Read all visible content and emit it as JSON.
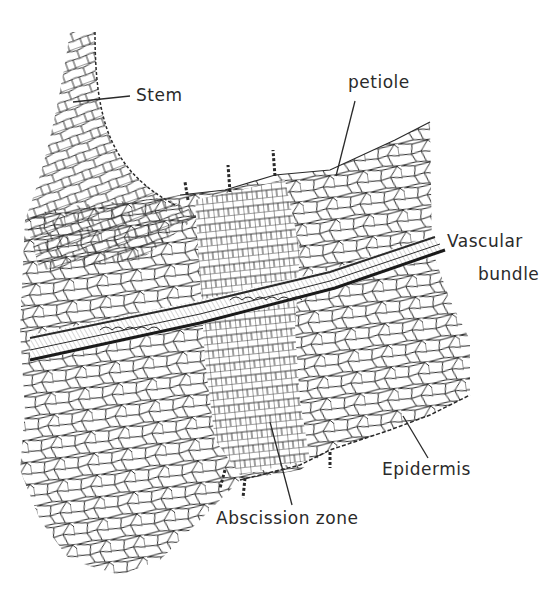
{
  "diagram": {
    "type": "botanical cross-section illustration",
    "colors": {
      "ink": "#2a2a2a",
      "background": "#ffffff"
    },
    "labels": {
      "stem": "Stem",
      "petiole": "petiole",
      "vascular_line1": "Vascular",
      "vascular_line2": "bundle",
      "epidermis": "Epidermis",
      "abscission_zone": "Abscission zone"
    }
  }
}
